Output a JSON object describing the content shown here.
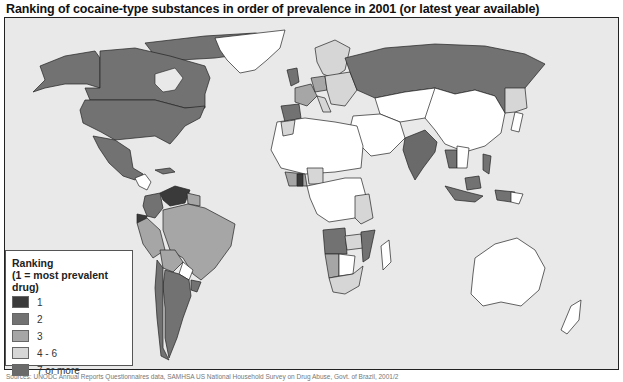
{
  "title": "Ranking of cocaine-type substances in order of prevalence  in 2001 (or latest year available)",
  "legend": {
    "title_line1": "Ranking",
    "title_line2": "(1 = most prevalent drug)",
    "items": [
      {
        "label": "1",
        "color": "#3a3a3a"
      },
      {
        "label": "2",
        "color": "#727272"
      },
      {
        "label": "3",
        "color": "#a6a6a6"
      },
      {
        "label": "4 - 6",
        "color": "#d6d6d6"
      },
      {
        "label": "7 or more",
        "color": "#6a6a6a"
      }
    ],
    "no_data_color": "#ffffff"
  },
  "colors": {
    "ocean": "#e9e9e9",
    "border": "#222222"
  },
  "source": "Sources: UNODC Annual Reports Questionnaires data, SAMHSA US National Household Survey on Drug Abuse, Govt. of Brazil, 2001/2",
  "regions": [
    {
      "name": "Canada",
      "rank": "2"
    },
    {
      "name": "United States",
      "rank": "2"
    },
    {
      "name": "Mexico",
      "rank": "2"
    },
    {
      "name": "Greenland",
      "rank": "none"
    },
    {
      "name": "Venezuela",
      "rank": "1"
    },
    {
      "name": "Colombia",
      "rank": "2"
    },
    {
      "name": "Ecuador",
      "rank": "1"
    },
    {
      "name": "Brazil",
      "rank": "3"
    },
    {
      "name": "Peru",
      "rank": "3"
    },
    {
      "name": "Bolivia",
      "rank": "3"
    },
    {
      "name": "Paraguay",
      "rank": "none"
    },
    {
      "name": "Argentina",
      "rank": "2"
    },
    {
      "name": "Chile",
      "rank": "2"
    },
    {
      "name": "Uruguay",
      "rank": "2"
    },
    {
      "name": "Spain",
      "rank": "2"
    },
    {
      "name": "Russia",
      "rank": "7 or more"
    },
    {
      "name": "India",
      "rank": "7 or more"
    },
    {
      "name": "Angola",
      "rank": "2"
    },
    {
      "name": "Namibia",
      "rank": "3"
    },
    {
      "name": "Australia",
      "rank": "4 - 6"
    }
  ]
}
